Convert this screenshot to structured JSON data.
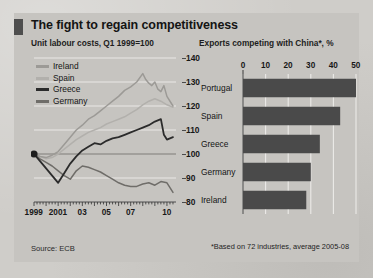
{
  "figure": {
    "title": "The fight to regain competitiveness",
    "source": "Source: ECB",
    "footnote": "*Based on 72 industries, average 2005-08",
    "background_color": "#cfcdc9",
    "panel_color": "#c6c4c0",
    "accent_color": "#4e4e4e"
  },
  "chart_data": [
    {
      "type": "line",
      "title": "Unit labour costs, Q1 1999=100",
      "xlabel": "",
      "ylabel": "",
      "ylim": [
        80,
        140
      ],
      "yticks": [
        80,
        90,
        100,
        110,
        120,
        130,
        140
      ],
      "xlim": [
        1999,
        2010.75
      ],
      "xticks": [
        1999,
        2001,
        2003,
        2005,
        2007,
        2010
      ],
      "xticklabels": [
        "1999",
        "2001",
        "03",
        "05",
        "07",
        "10"
      ],
      "grid": true,
      "legend_position": "top-left",
      "marker_note": "start dot at 1999 = 100",
      "series": [
        {
          "name": "Ireland",
          "color": "#9c9a96",
          "x": [
            1999.0,
            1999.5,
            2000.0,
            2000.5,
            2001.0,
            2001.5,
            2002.0,
            2002.5,
            2003.0,
            2003.5,
            2004.0,
            2004.5,
            2005.0,
            2005.5,
            2006.0,
            2006.5,
            2007.0,
            2007.5,
            2008.0,
            2008.25,
            2008.5,
            2008.75,
            2009.0,
            2009.25,
            2009.5,
            2009.75,
            2010.0,
            2010.5
          ],
          "values": [
            100,
            99,
            98.5,
            99.5,
            101,
            104,
            107,
            110,
            112,
            114.5,
            116,
            118,
            120,
            122,
            124,
            126.5,
            128,
            130,
            133.5,
            131,
            129.5,
            128.5,
            130,
            127,
            126,
            128.5,
            124,
            120
          ]
        },
        {
          "name": "Spain",
          "color": "#b2b0ac",
          "x": [
            1999.0,
            1999.5,
            2000.0,
            2000.5,
            2001.0,
            2001.5,
            2002.0,
            2002.5,
            2003.0,
            2003.5,
            2004.0,
            2004.5,
            2005.0,
            2005.5,
            2006.0,
            2006.5,
            2007.0,
            2007.5,
            2008.0,
            2008.5,
            2009.0,
            2009.5,
            2010.0,
            2010.5
          ],
          "values": [
            100,
            99,
            98,
            98.5,
            100,
            102,
            104,
            106,
            107.5,
            109,
            110,
            111,
            112.5,
            113.5,
            114.5,
            115.5,
            117,
            118.5,
            120.5,
            122,
            123,
            122,
            120.5,
            119.5
          ]
        },
        {
          "name": "Greece",
          "color": "#2b2b2b",
          "x": [
            1999.0,
            1999.5,
            2000.0,
            2000.5,
            2001.0,
            2001.5,
            2002.0,
            2002.5,
            2003.0,
            2003.5,
            2004.0,
            2004.5,
            2005.0,
            2005.5,
            2006.0,
            2006.5,
            2007.0,
            2007.5,
            2008.0,
            2008.5,
            2009.0,
            2009.5,
            2009.75,
            2010.0,
            2010.5
          ],
          "values": [
            100,
            97,
            94,
            91,
            88,
            92,
            96,
            99,
            101.5,
            103,
            104.5,
            104,
            105.5,
            106.5,
            107,
            108,
            109,
            110,
            111,
            112,
            113.5,
            114.5,
            108,
            106,
            107
          ]
        },
        {
          "name": "Germany",
          "color": "#6f6d69",
          "x": [
            1999.0,
            1999.5,
            2000.0,
            2000.5,
            2001.0,
            2001.5,
            2002.0,
            2002.5,
            2003.0,
            2003.5,
            2004.0,
            2004.5,
            2005.0,
            2005.5,
            2006.0,
            2006.5,
            2007.0,
            2007.5,
            2008.0,
            2008.5,
            2009.0,
            2009.5,
            2010.0,
            2010.5
          ],
          "values": [
            100,
            98,
            96.5,
            95,
            93,
            91,
            89.5,
            93,
            95,
            94.5,
            93.5,
            92.5,
            91,
            89.5,
            88,
            87,
            86.5,
            86.5,
            87.5,
            88,
            87,
            88.5,
            88,
            84
          ]
        }
      ]
    },
    {
      "type": "bar",
      "orientation": "horizontal",
      "title": "Exports competing with China*, %",
      "xlabel": "",
      "ylabel": "",
      "xlim": [
        0,
        50
      ],
      "xticks": [
        0,
        10,
        20,
        30,
        40,
        50
      ],
      "xticklabels": [
        "0",
        "10",
        "20",
        "30",
        "40",
        "50"
      ],
      "grid": true,
      "bar_color": "#4a4a4a",
      "categories": [
        "Portugal",
        "Spain",
        "Greece",
        "Germany",
        "Ireland"
      ],
      "values": [
        50,
        43,
        34,
        30,
        28
      ]
    }
  ]
}
